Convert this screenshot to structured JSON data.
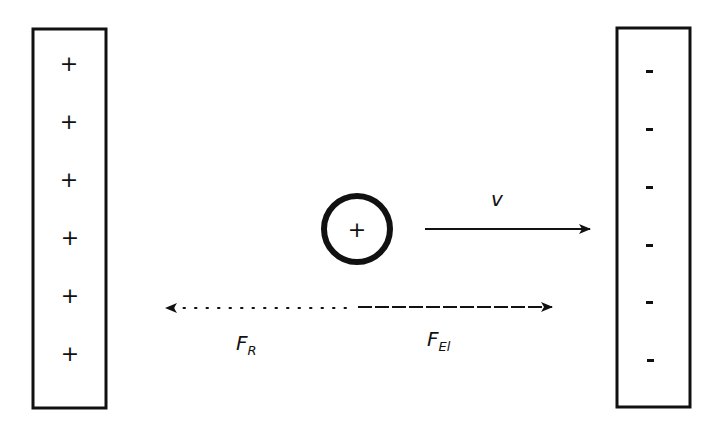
{
  "diagram": {
    "type": "charged particle between capacitor plates",
    "left_plate": {
      "charge_sign": "+",
      "symbols": [
        "+",
        "+",
        "+",
        "+",
        "+",
        "+"
      ]
    },
    "right_plate": {
      "charge_sign": "-",
      "symbols": [
        "-",
        "-",
        "-",
        "-",
        "-",
        "-"
      ]
    },
    "particle": {
      "charge_symbol": "+"
    },
    "velocity": {
      "label": "v",
      "direction": "right"
    },
    "forces": {
      "friction": {
        "label": "F",
        "subscript": "R",
        "direction": "left",
        "style": "dotted"
      },
      "electric": {
        "label": "F",
        "subscript": "El",
        "direction": "right",
        "style": "dashed"
      }
    },
    "colors": {
      "stroke": "#111111",
      "background": "#ffffff"
    }
  }
}
